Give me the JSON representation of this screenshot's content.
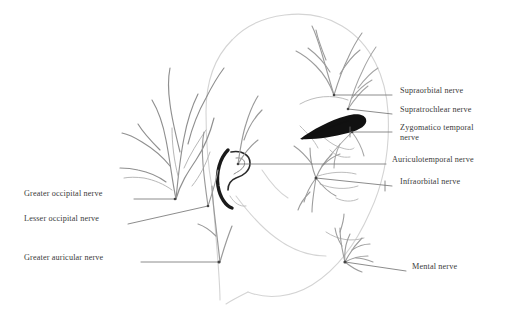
{
  "figure": {
    "background_color": "#ffffff",
    "text_color": "#3a3a3a",
    "line_color": "#9a9a9a",
    "accent_color": "#111111",
    "width": 516,
    "height": 320
  },
  "labels": {
    "supraorbital": "Supraorbital nerve",
    "supratrochlear": "Supratrochlear nerve",
    "zygomaticotemporal": "Zygomatico temporal nerve",
    "auriculotemporal": "Auriculotemporal nerve",
    "infraorbital": "Infraorbital nerve",
    "mental": "Mental nerve",
    "greater_occipital": "Greater occipital nerve",
    "lesser_occipital": "Lesser occipital nerve",
    "greater_auricular": "Greater auricular nerve"
  },
  "annotations": [
    {
      "id": "supraorbital",
      "label": "Supraorbital nerve",
      "side": "right",
      "text_x": 400,
      "text_y": 91,
      "leader_from_x": 392,
      "leader_from_y": 95,
      "leader_to_x": 334,
      "leader_to_y": 95
    },
    {
      "id": "supratrochlear",
      "label": "Supratrochlear nerve",
      "side": "right",
      "text_x": 400,
      "text_y": 110,
      "leader_from_x": 392,
      "leader_from_y": 114,
      "leader_to_x": 348,
      "leader_to_y": 109
    },
    {
      "id": "zygomaticotemporal",
      "label": "Zygomatico temporal nerve",
      "side": "right",
      "text_x": 400,
      "text_y": 128,
      "leader_from_x": 392,
      "leader_from_y": 132,
      "leader_to_x": 352,
      "leader_to_y": 132
    },
    {
      "id": "auriculotemporal",
      "label": "Auriculotemporal nerve",
      "side": "right",
      "text_x": 392,
      "text_y": 160,
      "leader_from_x": 386,
      "leader_from_y": 164,
      "leader_to_x": 238,
      "leader_to_y": 164
    },
    {
      "id": "infraorbital",
      "label": "Infraorbital nerve",
      "side": "right",
      "text_x": 400,
      "text_y": 182,
      "leader_from_x": 392,
      "leader_from_y": 186,
      "leader_to_x": 316,
      "leader_to_y": 178
    },
    {
      "id": "mental",
      "label": "Mental nerve",
      "side": "right",
      "text_x": 412,
      "text_y": 267,
      "leader_from_x": 406,
      "leader_from_y": 271,
      "leader_to_x": 345,
      "leader_to_y": 262
    },
    {
      "id": "greater_occipital",
      "label": "Greater occipital nerve",
      "side": "left",
      "text_x": 24,
      "text_y": 194,
      "leader_from_x": 134,
      "leader_from_y": 199,
      "leader_to_x": 175,
      "leader_to_y": 199
    },
    {
      "id": "lesser_occipital",
      "label": "Lesser occipital nerve",
      "side": "left",
      "text_x": 24,
      "text_y": 219,
      "leader_from_x": 128,
      "leader_from_y": 224,
      "leader_to_x": 208,
      "leader_to_y": 206
    },
    {
      "id": "greater_auricular",
      "label": "Greater auricular nerve",
      "side": "left",
      "text_x": 24,
      "text_y": 258,
      "leader_from_x": 141,
      "leader_from_y": 262,
      "leader_to_x": 219,
      "leader_to_y": 262
    }
  ]
}
